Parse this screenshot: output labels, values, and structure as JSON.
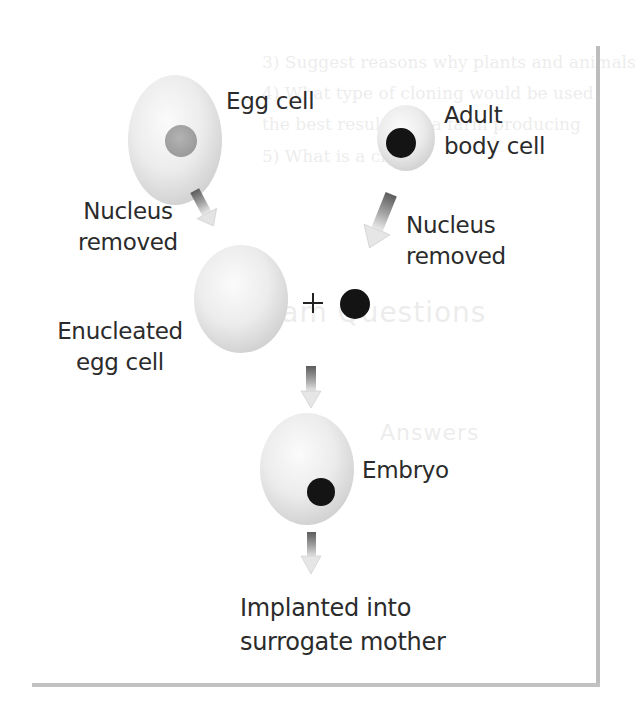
{
  "diagram": {
    "nodes": [
      {
        "id": "egg-cell",
        "label_lines": [
          "Egg cell"
        ],
        "has_nucleus": true,
        "nucleus_color": "#a9a9a9"
      },
      {
        "id": "adult-body-cell",
        "label_lines": [
          "Adult",
          "body cell"
        ],
        "has_nucleus": true,
        "nucleus_color": "#141414"
      },
      {
        "id": "enucleated-egg-cell",
        "label_lines": [
          "Enucleated",
          "egg cell"
        ],
        "has_nucleus": false
      },
      {
        "id": "donor-nucleus",
        "label_lines": [],
        "has_nucleus": true,
        "nucleus_color": "#141414"
      },
      {
        "id": "embryo",
        "label_lines": [
          "Embryo"
        ],
        "has_nucleus": true,
        "nucleus_color": "#141414"
      },
      {
        "id": "surrogate",
        "label_lines": [
          "Implanted into",
          "surrogate mother"
        ],
        "has_nucleus": false
      }
    ],
    "edges": [
      {
        "from": "egg-cell",
        "to": "enucleated-egg-cell",
        "label_lines": [
          "Nucleus",
          "removed"
        ]
      },
      {
        "from": "adult-body-cell",
        "to": "donor-nucleus",
        "label_lines": [
          "Nucleus",
          "removed"
        ]
      },
      {
        "from": "enucleated-egg-cell+donor-nucleus",
        "to": "embryo",
        "label_lines": []
      },
      {
        "from": "embryo",
        "to": "surrogate",
        "label_lines": []
      }
    ],
    "operator": "+"
  },
  "labels": {
    "egg_cell": "Egg cell",
    "adult_line1": "Adult",
    "adult_line2": "body cell",
    "removed_left_line1": "Nucleus",
    "removed_left_line2": "removed",
    "removed_right_line1": "Nucleus",
    "removed_right_line2": "removed",
    "enucleated_line1": "Enucleated",
    "enucleated_line2": "egg cell",
    "plus": "+",
    "embryo": "Embryo",
    "implanted_line1": "Implanted into",
    "implanted_line2": "surrogate mother"
  },
  "show_through": {
    "line1": "3)  Suggest reasons why plants and animals",
    "line2": "4)  What type of cloning would be used",
    "line3": "      the best results for a farm producing",
    "line4": "5)  What is a clone?",
    "heading": "Exam Questions",
    "sub": "Answers"
  },
  "colors": {
    "cell_fill_light": "#f4f4f4",
    "cell_fill_shade": "#d6d6d6",
    "nucleus_dark": "#141414",
    "nucleus_grey": "#a9a9a9",
    "arrow_dark": "#6a6a6a",
    "arrow_light": "#e2e2e2",
    "frame": "#bdbdbd",
    "text": "#2b2b2b"
  }
}
